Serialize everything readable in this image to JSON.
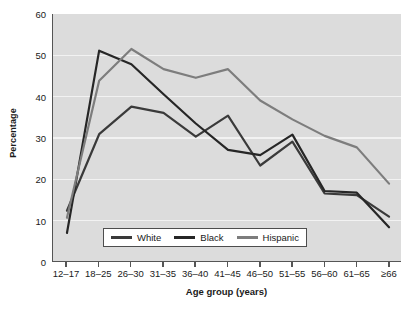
{
  "chart_data": {
    "type": "line",
    "title": "",
    "xlabel": "Age group (years)",
    "ylabel": "Percentage",
    "categories": [
      "12–17",
      "18–25",
      "26–30",
      "31–35",
      "36–40",
      "41–45",
      "46–50",
      "51–55",
      "56–60",
      "61–65",
      "≥66"
    ],
    "ylim": [
      0,
      60
    ],
    "yticks": [
      0,
      10,
      20,
      30,
      40,
      50,
      60
    ],
    "grid": "horizontal",
    "legend_position": "bottom-center",
    "series": [
      {
        "name": "White",
        "color": "#3a3a3a",
        "values": [
          12.2,
          30.8,
          37.5,
          36.0,
          30.2,
          35.3,
          23.2,
          29.0,
          16.4,
          16.0,
          10.8
        ]
      },
      {
        "name": "Black",
        "color": "#262626",
        "values": [
          6.8,
          51.1,
          47.8,
          40.5,
          33.4,
          27.0,
          25.7,
          30.7,
          17.0,
          16.6,
          8.2
        ]
      },
      {
        "name": "Hispanic",
        "color": "#7d7d7d",
        "values": [
          10.5,
          43.8,
          51.5,
          46.6,
          44.5,
          46.6,
          39.0,
          34.4,
          30.4,
          27.6,
          18.8
        ]
      }
    ]
  },
  "legend": {
    "items": [
      {
        "label": "White",
        "color": "#3a3a3a"
      },
      {
        "label": "Black",
        "color": "#262626"
      },
      {
        "label": "Hispanic",
        "color": "#7d7d7d"
      }
    ]
  },
  "colors": {
    "plot_background": "#dcdcdc",
    "gridline": "#f2f2f2",
    "axis": "#555555",
    "text": "#1a1a1a",
    "page_background": "#ffffff"
  }
}
